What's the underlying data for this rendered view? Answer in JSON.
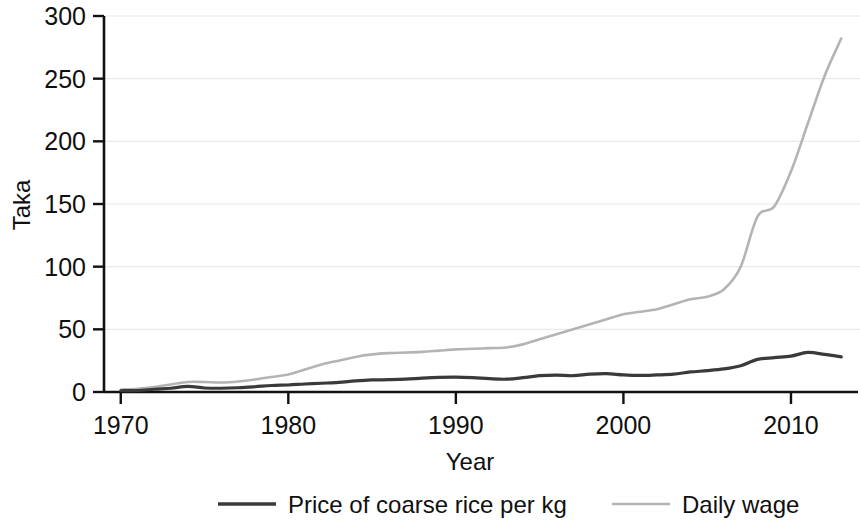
{
  "chart_data": {
    "type": "line",
    "title": "",
    "xlabel": "Year",
    "ylabel": "Taka",
    "xlim": [
      1969,
      2014
    ],
    "ylim": [
      0,
      300
    ],
    "xticks": [
      1970,
      1980,
      1990,
      2000,
      2010
    ],
    "xtick_labels": [
      "1970",
      "1980",
      "1990",
      "2000",
      "2010"
    ],
    "yticks": [
      0,
      50,
      100,
      150,
      200,
      250,
      300
    ],
    "ytick_labels": [
      "0",
      "50",
      "100",
      "150",
      "200",
      "250",
      "300"
    ],
    "grid": "horizontal",
    "legend_position": "bottom",
    "x": [
      1970,
      1971,
      1972,
      1973,
      1974,
      1975,
      1976,
      1977,
      1978,
      1979,
      1980,
      1981,
      1982,
      1983,
      1984,
      1985,
      1986,
      1987,
      1988,
      1989,
      1990,
      1991,
      1992,
      1993,
      1994,
      1995,
      1996,
      1997,
      1998,
      1999,
      2000,
      2001,
      2002,
      2003,
      2004,
      2005,
      2006,
      2007,
      2008,
      2009,
      2010,
      2011,
      2012,
      2013
    ],
    "series": [
      {
        "name": "Price of coarse rice per kg",
        "color": "#3a3a3a",
        "width": 3.2,
        "values": [
          1.0,
          1.2,
          2.2,
          3.0,
          4.5,
          3.2,
          3.0,
          3.4,
          4.2,
          5.2,
          5.6,
          6.4,
          7.0,
          7.6,
          8.8,
          9.6,
          9.8,
          10.2,
          11.0,
          11.6,
          11.8,
          11.4,
          10.6,
          10.2,
          11.4,
          13.0,
          13.4,
          13.0,
          14.2,
          14.6,
          13.6,
          13.2,
          13.6,
          14.2,
          16.0,
          17.0,
          18.4,
          21.0,
          26.0,
          27.4,
          28.6,
          31.6,
          30.0,
          28.0
        ]
      },
      {
        "name": "Daily wage",
        "color": "#b4b4b4",
        "width": 2.6,
        "values": [
          2.0,
          2.6,
          4.0,
          6.0,
          8.0,
          8.0,
          7.6,
          8.4,
          10.0,
          12.0,
          14.0,
          18.0,
          22.0,
          25.0,
          28.0,
          30.0,
          31.0,
          31.5,
          32.0,
          33.0,
          34.0,
          34.5,
          35.0,
          35.5,
          38.0,
          42.0,
          46.0,
          50.0,
          54.0,
          58.0,
          62.0,
          64.0,
          66.0,
          70.0,
          74.0,
          76.0,
          82.0,
          100.0,
          140.0,
          148.0,
          176.0,
          214.0,
          252.0,
          282.0
        ]
      }
    ]
  },
  "legend": {
    "items": [
      {
        "label": "Price of coarse rice per kg",
        "color": "#3a3a3a"
      },
      {
        "label": "Daily wage",
        "color": "#b4b4b4"
      }
    ]
  }
}
